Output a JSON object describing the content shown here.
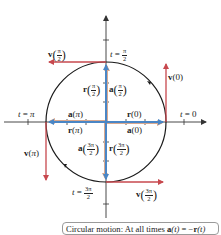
{
  "figure": {
    "colors": {
      "position_vector": "#4a86c5",
      "acceleration_vector": "#d9a98f",
      "velocity_vector": "#c7484e",
      "circle": "#1a1a1a",
      "axes": "#333333"
    },
    "time_labels": {
      "t0": {
        "t": "t",
        "eq": "=",
        "val": "0"
      },
      "t_pi_over_2": {
        "t": "t",
        "eq": "=",
        "num": "π",
        "den": "2"
      },
      "t_pi": {
        "t": "t",
        "eq": "=",
        "val": "π"
      },
      "t_3pi_over_2": {
        "t": "t",
        "eq": "=",
        "num": "3π",
        "den": "2"
      }
    },
    "vector_labels": {
      "r0": {
        "sym": "r",
        "arg": "0"
      },
      "a0": {
        "sym": "a",
        "arg": "0"
      },
      "v0": {
        "sym": "v",
        "arg": "0"
      },
      "r_pi2": {
        "sym": "r",
        "num": "π",
        "den": "2"
      },
      "a_pi2": {
        "sym": "a",
        "num": "π",
        "den": "2"
      },
      "v_pi2": {
        "sym": "v",
        "num": "π",
        "den": "2"
      },
      "r_pi": {
        "sym": "r",
        "arg": "π"
      },
      "a_pi": {
        "sym": "a",
        "arg": "π"
      },
      "v_pi": {
        "sym": "v",
        "arg": "π"
      },
      "r_3pi2": {
        "sym": "r",
        "num": "3π",
        "den": "2"
      },
      "a_3pi2": {
        "sym": "a",
        "num": "3π",
        "den": "2"
      },
      "v_3pi2": {
        "sym": "v",
        "num": "3π",
        "den": "2"
      }
    }
  },
  "caption": {
    "prefix": "Circular motion: At all times ",
    "a": "a",
    "t1": "(t)",
    "eq": " = −",
    "r": "r",
    "t2": "(t)"
  }
}
